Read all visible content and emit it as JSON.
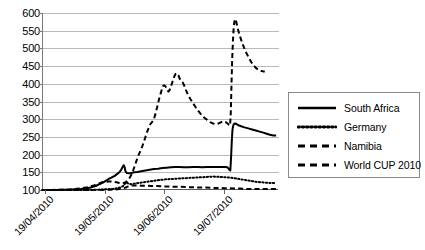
{
  "chart_data": {
    "type": "line",
    "title": "",
    "xlabel": "",
    "ylabel": "",
    "ylim": [
      100,
      600
    ],
    "ytick_step": 50,
    "ytick_labels": [
      "600",
      "550",
      "500",
      "450",
      "400",
      "350",
      "300",
      "250",
      "200",
      "150",
      "100"
    ],
    "ytick_values": [
      600,
      550,
      500,
      450,
      400,
      350,
      300,
      250,
      200,
      150,
      100
    ],
    "grid": true,
    "legend_position": "right",
    "xtick_labels": [
      "19/04/2010",
      "19/05/2010",
      "19/06/2010",
      "19/07/2010"
    ],
    "xtick_positions": [
      0.0125,
      0.265,
      0.518,
      0.772
    ],
    "xaxis_note": "daily index, 19/04/2010 through early 08/2010",
    "series": [
      {
        "name": "South Africa",
        "style": "solid",
        "peak_value": 288,
        "start_value": 100,
        "end_value": 254,
        "points": [
          [
            0.0,
            100
          ],
          [
            0.03,
            100
          ],
          [
            0.06,
            100
          ],
          [
            0.09,
            101
          ],
          [
            0.115,
            101
          ],
          [
            0.14,
            102
          ],
          [
            0.165,
            103
          ],
          [
            0.19,
            105
          ],
          [
            0.212,
            108
          ],
          [
            0.23,
            112
          ],
          [
            0.245,
            117
          ],
          [
            0.258,
            121
          ],
          [
            0.27,
            126
          ],
          [
            0.282,
            131
          ],
          [
            0.292,
            134
          ],
          [
            0.3,
            137
          ],
          [
            0.308,
            140
          ],
          [
            0.316,
            144
          ],
          [
            0.324,
            148
          ],
          [
            0.33,
            152
          ],
          [
            0.336,
            158
          ],
          [
            0.341,
            164
          ],
          [
            0.346,
            170
          ],
          [
            0.35,
            165
          ],
          [
            0.354,
            152
          ],
          [
            0.36,
            148
          ],
          [
            0.368,
            147
          ],
          [
            0.378,
            148
          ],
          [
            0.39,
            150
          ],
          [
            0.404,
            151
          ],
          [
            0.42,
            153
          ],
          [
            0.438,
            155
          ],
          [
            0.456,
            157
          ],
          [
            0.474,
            159
          ],
          [
            0.492,
            160
          ],
          [
            0.51,
            162
          ],
          [
            0.528,
            163
          ],
          [
            0.546,
            164
          ],
          [
            0.564,
            165
          ],
          [
            0.582,
            165
          ],
          [
            0.6,
            164
          ],
          [
            0.62,
            164
          ],
          [
            0.64,
            165
          ],
          [
            0.66,
            165
          ],
          [
            0.68,
            164
          ],
          [
            0.7,
            165
          ],
          [
            0.72,
            165
          ],
          [
            0.74,
            165
          ],
          [
            0.76,
            165
          ],
          [
            0.775,
            165
          ],
          [
            0.786,
            164
          ],
          [
            0.793,
            158
          ],
          [
            0.798,
            155
          ],
          [
            0.801,
            190
          ],
          [
            0.804,
            235
          ],
          [
            0.807,
            270
          ],
          [
            0.811,
            284
          ],
          [
            0.816,
            288
          ],
          [
            0.823,
            287
          ],
          [
            0.832,
            283
          ],
          [
            0.844,
            280
          ],
          [
            0.858,
            277
          ],
          [
            0.874,
            274
          ],
          [
            0.89,
            271
          ],
          [
            0.906,
            268
          ],
          [
            0.922,
            265
          ],
          [
            0.938,
            262
          ],
          [
            0.952,
            259
          ],
          [
            0.966,
            256
          ],
          [
            0.98,
            254
          ],
          [
            0.992,
            254
          ]
        ]
      },
      {
        "name": "Germany",
        "style": "dotted",
        "peak_value": 138,
        "start_value": 100,
        "end_value": 120,
        "points": [
          [
            0.0,
            100
          ],
          [
            0.05,
            100
          ],
          [
            0.1,
            100
          ],
          [
            0.15,
            100
          ],
          [
            0.2,
            100
          ],
          [
            0.24,
            101
          ],
          [
            0.27,
            102
          ],
          [
            0.3,
            103
          ],
          [
            0.32,
            105
          ],
          [
            0.335,
            108
          ],
          [
            0.345,
            112
          ],
          [
            0.352,
            118
          ],
          [
            0.358,
            122
          ],
          [
            0.366,
            118
          ],
          [
            0.378,
            116
          ],
          [
            0.392,
            118
          ],
          [
            0.41,
            120
          ],
          [
            0.43,
            122
          ],
          [
            0.452,
            124
          ],
          [
            0.474,
            126
          ],
          [
            0.496,
            128
          ],
          [
            0.52,
            130
          ],
          [
            0.545,
            131
          ],
          [
            0.57,
            132
          ],
          [
            0.596,
            133
          ],
          [
            0.622,
            134
          ],
          [
            0.648,
            135
          ],
          [
            0.674,
            136
          ],
          [
            0.7,
            137
          ],
          [
            0.726,
            138
          ],
          [
            0.752,
            137
          ],
          [
            0.776,
            136
          ],
          [
            0.798,
            135
          ],
          [
            0.818,
            133
          ],
          [
            0.836,
            131
          ],
          [
            0.854,
            129
          ],
          [
            0.872,
            127
          ],
          [
            0.89,
            125
          ],
          [
            0.908,
            123
          ],
          [
            0.926,
            122
          ],
          [
            0.944,
            121
          ],
          [
            0.962,
            120
          ],
          [
            0.98,
            120
          ],
          [
            0.992,
            120
          ]
        ]
      },
      {
        "name": "Namibia",
        "style": "dashed",
        "peak_value": 430,
        "start_value": 100,
        "end_value": 435,
        "points": [
          [
            0.0,
            100
          ],
          [
            0.04,
            100
          ],
          [
            0.08,
            101
          ],
          [
            0.12,
            102
          ],
          [
            0.16,
            104
          ],
          [
            0.195,
            108
          ],
          [
            0.22,
            113
          ],
          [
            0.24,
            118
          ],
          [
            0.255,
            122
          ],
          [
            0.268,
            123
          ],
          [
            0.28,
            124
          ],
          [
            0.292,
            124
          ],
          [
            0.304,
            123
          ],
          [
            0.316,
            122
          ],
          [
            0.328,
            120
          ],
          [
            0.34,
            119
          ],
          [
            0.352,
            121
          ],
          [
            0.362,
            126
          ],
          [
            0.37,
            133
          ],
          [
            0.378,
            142
          ],
          [
            0.386,
            155
          ],
          [
            0.394,
            170
          ],
          [
            0.402,
            186
          ],
          [
            0.41,
            200
          ],
          [
            0.418,
            212
          ],
          [
            0.424,
            222
          ],
          [
            0.43,
            233
          ],
          [
            0.436,
            245
          ],
          [
            0.442,
            258
          ],
          [
            0.45,
            272
          ],
          [
            0.458,
            285
          ],
          [
            0.466,
            292
          ],
          [
            0.474,
            300
          ],
          [
            0.482,
            318
          ],
          [
            0.49,
            340
          ],
          [
            0.498,
            362
          ],
          [
            0.506,
            380
          ],
          [
            0.512,
            393
          ],
          [
            0.518,
            396
          ],
          [
            0.524,
            392
          ],
          [
            0.53,
            383
          ],
          [
            0.536,
            378
          ],
          [
            0.542,
            384
          ],
          [
            0.548,
            396
          ],
          [
            0.554,
            408
          ],
          [
            0.56,
            420
          ],
          [
            0.566,
            428
          ],
          [
            0.572,
            430
          ],
          [
            0.578,
            424
          ],
          [
            0.584,
            414
          ],
          [
            0.59,
            408
          ],
          [
            0.596,
            404
          ],
          [
            0.602,
            396
          ],
          [
            0.61,
            382
          ],
          [
            0.618,
            370
          ],
          [
            0.628,
            358
          ],
          [
            0.64,
            345
          ],
          [
            0.652,
            333
          ],
          [
            0.664,
            322
          ],
          [
            0.676,
            312
          ],
          [
            0.688,
            304
          ],
          [
            0.7,
            298
          ],
          [
            0.712,
            292
          ],
          [
            0.724,
            288
          ],
          [
            0.736,
            286
          ],
          [
            0.748,
            288
          ],
          [
            0.76,
            292
          ],
          [
            0.77,
            294
          ],
          [
            0.778,
            292
          ],
          [
            0.786,
            288
          ],
          [
            0.792,
            284
          ],
          [
            0.797,
            282
          ],
          [
            0.8,
            320
          ],
          [
            0.803,
            400
          ],
          [
            0.806,
            470
          ],
          [
            0.809,
            520
          ],
          [
            0.812,
            555
          ],
          [
            0.815,
            575
          ],
          [
            0.818,
            583
          ],
          [
            0.822,
            578
          ],
          [
            0.828,
            560
          ],
          [
            0.836,
            540
          ],
          [
            0.846,
            520
          ],
          [
            0.856,
            502
          ],
          [
            0.866,
            487
          ],
          [
            0.876,
            474
          ],
          [
            0.886,
            462
          ],
          [
            0.896,
            452
          ],
          [
            0.906,
            445
          ],
          [
            0.916,
            440
          ],
          [
            0.926,
            437
          ],
          [
            0.936,
            435
          ],
          [
            0.944,
            435
          ]
        ]
      },
      {
        "name": "World CUP 2010",
        "style": "dashed",
        "peak_value": 115,
        "start_value": 100,
        "end_value": 103,
        "points": [
          [
            0.0,
            100
          ],
          [
            0.06,
            100
          ],
          [
            0.12,
            100
          ],
          [
            0.18,
            100
          ],
          [
            0.24,
            100
          ],
          [
            0.29,
            101
          ],
          [
            0.32,
            102
          ],
          [
            0.34,
            104
          ],
          [
            0.355,
            107
          ],
          [
            0.365,
            110
          ],
          [
            0.375,
            112
          ],
          [
            0.388,
            113
          ],
          [
            0.404,
            113
          ],
          [
            0.422,
            112
          ],
          [
            0.442,
            112
          ],
          [
            0.464,
            111
          ],
          [
            0.488,
            111
          ],
          [
            0.512,
            110
          ],
          [
            0.538,
            110
          ],
          [
            0.564,
            109
          ],
          [
            0.59,
            109
          ],
          [
            0.616,
            108
          ],
          [
            0.642,
            108
          ],
          [
            0.668,
            107
          ],
          [
            0.694,
            107
          ],
          [
            0.72,
            106
          ],
          [
            0.746,
            106
          ],
          [
            0.772,
            105
          ],
          [
            0.796,
            105
          ],
          [
            0.818,
            104
          ],
          [
            0.838,
            104
          ],
          [
            0.858,
            103
          ],
          [
            0.878,
            103
          ],
          [
            0.898,
            103
          ],
          [
            0.918,
            103
          ],
          [
            0.938,
            103
          ],
          [
            0.958,
            103
          ],
          [
            0.978,
            103
          ],
          [
            0.992,
            103
          ]
        ]
      }
    ]
  },
  "legend": {
    "items": [
      {
        "label": "South Africa",
        "swatch": "solid-line-swatch"
      },
      {
        "label": "Germany",
        "swatch": "dotted-line-swatch"
      },
      {
        "label": "Namibia",
        "swatch": "dashed-line-swatch"
      },
      {
        "label": "World CUP 2010",
        "swatch": "dashed-line-swatch"
      }
    ]
  },
  "colors": {
    "series_stroke": "#000000",
    "gridline": "#b9b9b9",
    "axis": "#6a6a6a",
    "background": "#ffffff"
  }
}
